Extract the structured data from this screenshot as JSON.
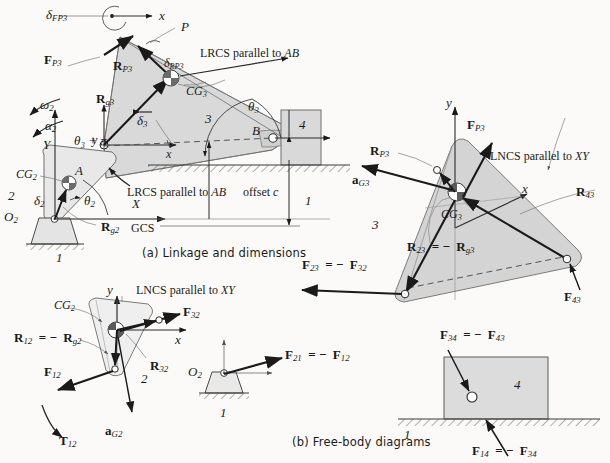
{
  "figure": {
    "title_a": "(a)  Linkage and dimensions",
    "title_b": "(b)  Free-body diagrams",
    "colors": {
      "link_fill": "#d6d6d6",
      "link_fill_light": "#e2e2e2",
      "stroke": "#4a4a4a",
      "arrow": "#1a1a1a",
      "background": "#fbfaf8",
      "pin_dark": "#6e6e6e"
    }
  },
  "part_a": {
    "caption": "(a)  Linkage and dimensions",
    "labels": {
      "delta_FP3": "δ",
      "delta_FP3_sub": "FP3",
      "F_P3": "F",
      "F_P3_sub": "P3",
      "x_axis_top": "x",
      "point_P": "P",
      "R_P3": "R",
      "R_P3_sub": "P3",
      "delta_RP3": "δ",
      "delta_RP3_sub": "RP3",
      "lrcs_top": "LRCS parallel to AB",
      "lrcs_top_italic": "AB",
      "CG3": "CG",
      "CG3_sub": "3",
      "R_g3": "R",
      "R_g3_sub": "g3",
      "link3_number": "3",
      "theta_3": "θ",
      "theta_3_sub": "3",
      "point_B": "B",
      "link4_number": "4",
      "delta_3": "δ",
      "delta_3_sub": "3",
      "theta3_pi": "θ₃ + π",
      "omega_2": "ω",
      "omega_2_sub": "2",
      "alpha_2": "α",
      "alpha_2_sub": "2",
      "Y_axis": "Y",
      "y_local": "y",
      "x_local": "x",
      "point_A": "A",
      "CG2": "CG",
      "CG2_sub": "2",
      "link2_number": "2",
      "delta_2": "δ",
      "delta_2_sub": "2",
      "theta_2": "θ",
      "theta_2_sub": "2",
      "O2": "O",
      "O2_sub": "2",
      "R_g2": "R",
      "R_g2_sub": "g2",
      "X_axis": "X",
      "GCS": "GCS",
      "ground_left": "1",
      "ground_right": "1",
      "lrcs_bottom": "LRCS parallel to AB",
      "offset_c": "offset",
      "offset_c_italic": "c"
    }
  },
  "part_b": {
    "caption": "(b)  Free-body diagrams",
    "link3_fbd": {
      "y_axis": "y",
      "x_axis": "x",
      "lncs": "LNCS parallel to XY",
      "lncs_italic": "XY",
      "F_P3": "F",
      "F_P3_sub": "P3",
      "R_P3": "R",
      "R_P3_sub": "P3",
      "a_G3": "a",
      "a_G3_sub": "G3",
      "CG3": "CG",
      "CG3_sub": "3",
      "link_number": "3",
      "R_43": "R",
      "R_43_sub": "43",
      "R_23_eq": "R₂₃ = − R",
      "R_23": "R",
      "R_23_sub": "23",
      "R_g3_sub": "g3",
      "F_23_eq": "F₂₃ = − F₃₂",
      "F_23": "F",
      "F_23_sub": "23",
      "F_32_sub": "32",
      "F_43": "F",
      "F_43_sub": "43"
    },
    "link2_fbd": {
      "y_axis": "y",
      "x_axis": "x",
      "lncs": "LNCS parallel to XY",
      "lncs_italic": "XY",
      "CG2": "CG",
      "CG2_sub": "2",
      "F_32": "F",
      "F_32_sub": "32",
      "R_12_eq": "R₁₂ = − R",
      "R_12": "R",
      "R_12_sub": "12",
      "R_g2_sub": "g2",
      "R_32": "R",
      "R_32_sub": "32",
      "F_12": "F",
      "F_12_sub": "12",
      "link_number": "2",
      "T_12": "T",
      "T_12_sub": "12",
      "a_G2": "a",
      "a_G2_sub": "G2"
    },
    "ground_fbd": {
      "O2": "O",
      "O2_sub": "2",
      "F_21_eq": "F₂₁  =  − F₁₂",
      "F_21": "F",
      "F_21_sub": "21",
      "F_12_sub": "12",
      "ground_number": "1"
    },
    "slider_fbd": {
      "F_34_eq": "F₃₄  =  − F₄₃",
      "F_34": "F",
      "F_34_sub": "34",
      "F_43_sub": "43",
      "link_number": "4",
      "ground_number": "1",
      "F_14_eq": "F₁₄ = − F₃₄",
      "F_14": "F",
      "F_14_sub": "14",
      "F_34_sub2": "34"
    }
  }
}
